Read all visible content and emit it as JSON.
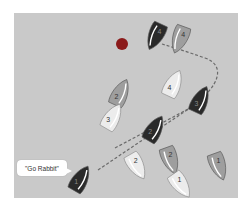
{
  "diagram": {
    "background_color": "#c9c9c9",
    "mark": {
      "name": "mark-buoy",
      "cx": 122,
      "cy": 44,
      "r": 6,
      "color": "#8b1a1a"
    },
    "callout": {
      "text": "\"Go Rabbit\"",
      "x": 17,
      "y": 160
    },
    "colors": {
      "dark": "#2a2a2a",
      "mid": "#9e9e9e",
      "light": "#ececec",
      "sail": "#ffffff",
      "dash": "#6a6a6a"
    },
    "boats": [
      {
        "id": "dark-4-top",
        "label": "4",
        "tone": "dark",
        "x": 156,
        "y": 35,
        "angle": 205
      },
      {
        "id": "mid-4-top",
        "label": "4",
        "tone": "mid",
        "x": 180,
        "y": 38,
        "angle": 200
      },
      {
        "id": "light-4",
        "label": "4",
        "tone": "light",
        "x": 173,
        "y": 85,
        "angle": 25
      },
      {
        "id": "mid-2-left",
        "label": "2",
        "tone": "mid",
        "x": 120,
        "y": 94,
        "angle": 25
      },
      {
        "id": "dark-3",
        "label": "3",
        "tone": "dark",
        "x": 200,
        "y": 101,
        "angle": 25
      },
      {
        "id": "light-3",
        "label": "3",
        "tone": "light",
        "x": 112,
        "y": 118,
        "angle": 30
      },
      {
        "id": "dark-2",
        "label": "2",
        "tone": "dark",
        "x": 154,
        "y": 130,
        "angle": 30
      },
      {
        "id": "light-2",
        "label": "2",
        "tone": "light",
        "x": 136,
        "y": 165,
        "angle": 150
      },
      {
        "id": "mid-2-right",
        "label": "2",
        "tone": "mid",
        "x": 170,
        "y": 159,
        "angle": 160
      },
      {
        "id": "mid-1",
        "label": "1",
        "tone": "mid",
        "x": 218,
        "y": 165,
        "angle": 160
      },
      {
        "id": "light-1",
        "label": "1",
        "tone": "light",
        "x": 180,
        "y": 184,
        "angle": 145
      },
      {
        "id": "dark-1",
        "label": "1",
        "tone": "dark",
        "x": 80,
        "y": 180,
        "angle": 30
      }
    ],
    "paths": [
      {
        "id": "rabbit-path",
        "d": "M 98 170 L 190 108 C 222 85, 225 65, 205 58 C 188 52, 175 48, 162 44"
      },
      {
        "id": "rabbit-path-2",
        "d": "M 115 148 L 205 100"
      }
    ]
  }
}
